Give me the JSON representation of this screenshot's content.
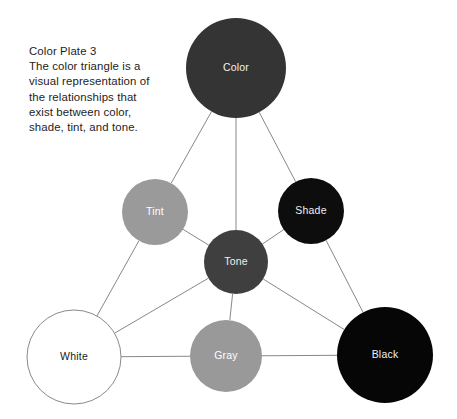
{
  "caption": {
    "lines": [
      "Color Plate 3",
      "The color triangle is a",
      "visual representation of",
      "the relationships that",
      "exist between color,",
      "shade, tint, and tone."
    ],
    "title": "Color Plate 3",
    "body": "The color triangle is a visual representation of the relationships that exist between color, shade, tint, and tone."
  },
  "chart_data": {
    "type": "diagram",
    "title": "Color Plate 3",
    "subtitle": "The color triangle",
    "background": "#ffffff",
    "edge_color": "#888888",
    "nodes": [
      {
        "id": "color",
        "label": "Color",
        "cx": 236,
        "cy": 68,
        "r": 50,
        "fill": "#343434",
        "text_color": "#f2f2f2",
        "outlined": false
      },
      {
        "id": "tint",
        "label": "Tint",
        "cx": 155,
        "cy": 212,
        "r": 33,
        "fill": "#9a9a9a",
        "text_color": "#ffffff",
        "outlined": false
      },
      {
        "id": "shade",
        "label": "Shade",
        "cx": 311,
        "cy": 211,
        "r": 33,
        "fill": "#0d0d0d",
        "text_color": "#f0f0f0",
        "outlined": false
      },
      {
        "id": "tone",
        "label": "Tone",
        "cx": 236,
        "cy": 262,
        "r": 32,
        "fill": "#3f3f3f",
        "text_color": "#f0f0f0",
        "outlined": false
      },
      {
        "id": "white",
        "label": "White",
        "cx": 74,
        "cy": 357,
        "r": 47,
        "fill": "#ffffff",
        "text_color": "#1a1a1a",
        "outlined": true
      },
      {
        "id": "gray",
        "label": "Gray",
        "cx": 226,
        "cy": 356,
        "r": 36,
        "fill": "#999999",
        "text_color": "#ffffff",
        "outlined": false
      },
      {
        "id": "black",
        "label": "Black",
        "cx": 385,
        "cy": 355,
        "r": 48,
        "fill": "#060606",
        "text_color": "#f0f0f0",
        "outlined": false
      }
    ],
    "edges": [
      {
        "from": "color",
        "to": "tint"
      },
      {
        "from": "color",
        "to": "tone"
      },
      {
        "from": "color",
        "to": "shade"
      },
      {
        "from": "tint",
        "to": "tone"
      },
      {
        "from": "tint",
        "to": "white"
      },
      {
        "from": "tone",
        "to": "shade"
      },
      {
        "from": "tone",
        "to": "white"
      },
      {
        "from": "tone",
        "to": "gray"
      },
      {
        "from": "tone",
        "to": "black"
      },
      {
        "from": "shade",
        "to": "black"
      },
      {
        "from": "white",
        "to": "gray"
      },
      {
        "from": "gray",
        "to": "black"
      }
    ]
  }
}
